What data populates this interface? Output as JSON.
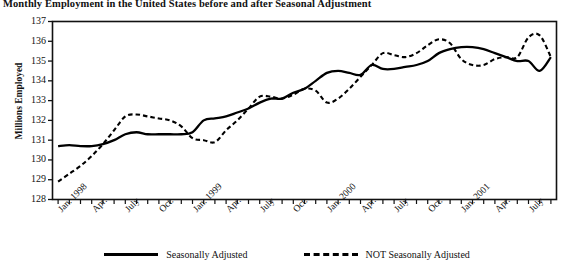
{
  "chart_data": {
    "type": "line",
    "title": "Monthly Employment in the United States before and after Seasonal Adjustment",
    "xlabel": "",
    "ylabel": "Millions Employed",
    "ylim": [
      128,
      137
    ],
    "y_ticks": [
      128,
      129,
      130,
      131,
      132,
      133,
      134,
      135,
      136,
      137
    ],
    "grid": false,
    "legend_position": "bottom",
    "x_tick_labels": [
      {
        "index": 0,
        "label": "Jan. 1998"
      },
      {
        "index": 3,
        "label": "Apr."
      },
      {
        "index": 6,
        "label": "July"
      },
      {
        "index": 9,
        "label": "Oct."
      },
      {
        "index": 12,
        "label": "Jan. 1999"
      },
      {
        "index": 15,
        "label": "Apr."
      },
      {
        "index": 18,
        "label": "July"
      },
      {
        "index": 21,
        "label": "Oct."
      },
      {
        "index": 24,
        "label": "Jan. 2000"
      },
      {
        "index": 27,
        "label": "Apr."
      },
      {
        "index": 30,
        "label": "July"
      },
      {
        "index": 33,
        "label": "Oct."
      },
      {
        "index": 36,
        "label": "Jan. 2001"
      },
      {
        "index": 39,
        "label": "Apr."
      },
      {
        "index": 42,
        "label": "July"
      }
    ],
    "x": [
      "Jan. 1998",
      "Feb. 1998",
      "Mar. 1998",
      "Apr. 1998",
      "May 1998",
      "June 1998",
      "July 1998",
      "Aug. 1998",
      "Sept. 1998",
      "Oct. 1998",
      "Nov. 1998",
      "Dec. 1998",
      "Jan. 1999",
      "Feb. 1999",
      "Mar. 1999",
      "Apr. 1999",
      "May 1999",
      "June 1999",
      "July 1999",
      "Aug. 1999",
      "Sept. 1999",
      "Oct. 1999",
      "Nov. 1999",
      "Dec. 1999",
      "Jan. 2000",
      "Feb. 2000",
      "Mar. 2000",
      "Apr. 2000",
      "May 2000",
      "June 2000",
      "July 2000",
      "Aug. 2000",
      "Sept. 2000",
      "Oct. 2000",
      "Nov. 2000",
      "Dec. 2000",
      "Jan. 2001",
      "Feb. 2001",
      "Mar. 2001",
      "Apr. 2001",
      "May 2001",
      "June 2001",
      "July 2001",
      "Aug. 2001",
      "Sept. 2001"
    ],
    "series": [
      {
        "name": "Seasonally Adjusted",
        "style": "solid",
        "color": "#000000",
        "values": [
          130.7,
          130.75,
          130.7,
          130.7,
          130.8,
          131.0,
          131.3,
          131.4,
          131.3,
          131.3,
          131.3,
          131.3,
          131.4,
          132.0,
          132.1,
          132.2,
          132.4,
          132.6,
          132.9,
          133.1,
          133.1,
          133.4,
          133.6,
          134.0,
          134.4,
          134.5,
          134.4,
          134.3,
          134.8,
          134.6,
          134.6,
          134.7,
          134.8,
          135.0,
          135.4,
          135.6,
          135.7,
          135.7,
          135.6,
          135.4,
          135.2,
          135.0,
          135.0,
          134.5,
          135.2
        ]
      },
      {
        "name": "NOT Seasonally Adjusted",
        "style": "dashed",
        "color": "#000000",
        "values": [
          128.9,
          129.3,
          129.7,
          130.2,
          130.8,
          131.5,
          132.2,
          132.3,
          132.2,
          132.1,
          132.0,
          131.7,
          131.1,
          131.0,
          130.9,
          131.5,
          132.0,
          132.6,
          133.2,
          133.2,
          133.1,
          133.3,
          133.6,
          133.5,
          132.9,
          133.1,
          133.6,
          134.2,
          134.8,
          135.4,
          135.3,
          135.2,
          135.4,
          135.8,
          136.1,
          135.9,
          135.1,
          134.8,
          134.8,
          135.1,
          135.2,
          135.2,
          136.2,
          136.3,
          135.2
        ]
      }
    ]
  },
  "legend": {
    "entries": [
      {
        "label": "Seasonally Adjusted",
        "style": "solid"
      },
      {
        "label": "NOT Seasonally Adjusted",
        "style": "dashed"
      }
    ]
  },
  "axis": {
    "y_title": "Millions Employed"
  }
}
